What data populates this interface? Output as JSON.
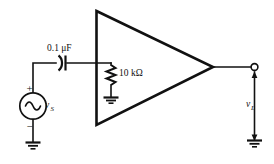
{
  "figure": {
    "background_color": "#ffffff",
    "line_color": "#111111",
    "width": 274,
    "height": 164
  },
  "components": {
    "source": {
      "name": "ac-voltage-source",
      "label": "v",
      "label_subscript": "S",
      "plus_sign": "+",
      "minus_sign": "−",
      "symbol": "sine-wave-circle"
    },
    "capacitor": {
      "name": "coupling-capacitor",
      "label": "0.1 μF",
      "symbol": "polarized-capacitor"
    },
    "resistor": {
      "name": "input-resistor",
      "label": "10 kΩ",
      "symbol": "zigzag-resistor"
    },
    "amplifier": {
      "name": "amplifier-triangle",
      "symbol": "triangle"
    },
    "output": {
      "name": "output-terminal",
      "label": "v",
      "label_subscript": "L",
      "symbol": "open-terminal-node"
    },
    "grounds": [
      {
        "name": "ground-source",
        "symbol": "earth-ground"
      },
      {
        "name": "ground-resistor",
        "symbol": "earth-ground"
      },
      {
        "name": "ground-load",
        "symbol": "earth-ground"
      }
    ]
  }
}
